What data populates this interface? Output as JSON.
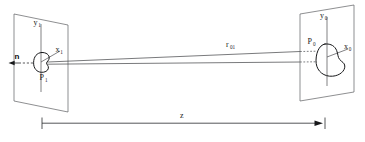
{
  "figure": {
    "kind": "technical-line-diagram",
    "background_color": "#ffffff",
    "line_color": "#55565a",
    "emphasis_color": "#17181a",
    "width": 365,
    "height": 142
  },
  "labels": {
    "y1": {
      "base": "y",
      "sub": "1"
    },
    "x1": {
      "base": "x",
      "sub": "1"
    },
    "p1": {
      "base": "P",
      "sub": "1"
    },
    "n": {
      "base": "n",
      "sub": ""
    },
    "y0": {
      "base": "y",
      "sub": "0"
    },
    "x0": {
      "base": "x",
      "sub": "0"
    },
    "p0": {
      "base": "P",
      "sub": "0"
    },
    "r01": {
      "base": "r",
      "sub": "01"
    },
    "z": {
      "base": "z",
      "sub": ""
    }
  },
  "elements": {
    "left_plane_name": "source-plane",
    "right_plane_name": "observation-plane",
    "left_aperture_name": "aperture-blob-p1",
    "right_aperture_name": "aperture-blob-p0",
    "ray_bundle_name": "ray-bundle-r01",
    "normal_vector_name": "normal-vector-n",
    "dimension_name": "z-dimension-line"
  },
  "geometry": {
    "left_plane_points": "14,14 68,25 68,112 14,101",
    "right_plane_points": "300,14 354,5 354,92 300,101",
    "left_axis_y": {
      "x": 41,
      "y_top": 24,
      "y_bottom": 92
    },
    "right_axis_y": {
      "x": 327,
      "y_top": 17,
      "y_bottom": 86
    },
    "z_line": {
      "x1": 42,
      "x2": 320,
      "y": 123
    }
  }
}
